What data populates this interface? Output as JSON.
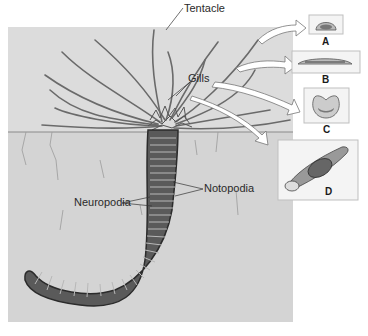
{
  "figure": {
    "labels": {
      "tentacle": "Tentacle",
      "gills": "Gills",
      "neuropodia": "Neuropodia",
      "notopodia": "Notopodia"
    },
    "panels": [
      {
        "letter": "A",
        "depicts": "tentacle cross-section, half-dome"
      },
      {
        "letter": "B",
        "depicts": "tentacle flattened cross-section"
      },
      {
        "letter": "C",
        "depicts": "tentacle U-shaped cross-section"
      },
      {
        "letter": "D",
        "depicts": "tentacle with food particle bolus"
      }
    ],
    "colors": {
      "sediment": "#d6d6d6",
      "water": "#dcdcdc",
      "worm": "#4a4a4a",
      "panel_border": "#bfbfbf"
    }
  }
}
